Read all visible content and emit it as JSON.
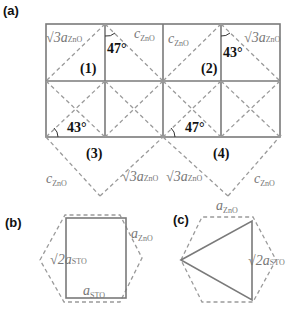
{
  "panels": {
    "a": {
      "label": "(a)"
    },
    "b": {
      "label": "(b)"
    },
    "c": {
      "label": "(c)"
    }
  },
  "grid_labels": {
    "cell1": "(1)",
    "cell2": "(2)",
    "cell3": "(3)",
    "cell4": "(4)"
  },
  "angles": {
    "a1": "47°",
    "a2": "43°",
    "a3": "43°",
    "a4": "47°"
  },
  "lattice_labels": {
    "sqrt3": "√3a",
    "c": "c",
    "a": "a",
    "sqrt2": "√2a",
    "zno": "ZnO",
    "sto": "STO"
  },
  "colors": {
    "solid_line": "#7a7a7a",
    "dashed_line": "#9a9a9a",
    "label_gray": "#777777",
    "text_black": "#111111"
  }
}
